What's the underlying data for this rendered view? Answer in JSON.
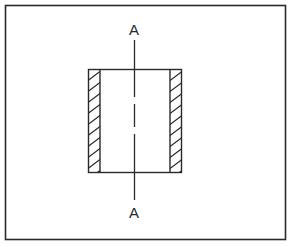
{
  "diagram": {
    "type": "section-view",
    "section_labels": {
      "top": "A",
      "bottom": "A"
    },
    "colors": {
      "background": "#ffffff",
      "stroke": "#2a2a2a"
    },
    "elements": [
      "outer frame",
      "rectangular body outline",
      "left hatched wall",
      "right hatched wall",
      "dashed center line",
      "cutting plane line A-A"
    ]
  }
}
